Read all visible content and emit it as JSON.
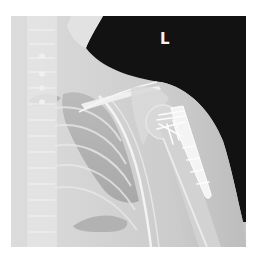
{
  "image": {
    "kind": "radiograph",
    "view": "left shoulder AP",
    "side_marker": "L",
    "colors": {
      "background": "#ffffff",
      "air": "#111111",
      "soft_tissue": "#c8c8c8",
      "bone": "#e6e6e6",
      "lung": "#a9a9a9",
      "hardware": "#fafafa"
    },
    "features": [
      "cervical and thoracic spine",
      "left clavicle",
      "left lung field",
      "ribs",
      "humeral head",
      "proximal humerus locking plate with screws"
    ]
  }
}
